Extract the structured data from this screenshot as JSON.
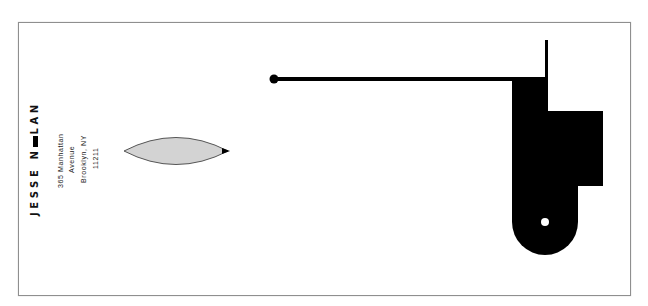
{
  "card": {
    "name": "JESSE N▬lAN",
    "name_display": "JESSE NOLAN",
    "address": {
      "line1": "365 Manhattan",
      "line2": "Avenue",
      "line3": "Brooklyn, NY",
      "line4": "11211"
    }
  },
  "colors": {
    "ink": "#000000",
    "leaf_fill": "#d3d3d3",
    "border": "#8f8f8f",
    "background": "#ffffff"
  },
  "graphics": {
    "leaf_shape": "lens-icon",
    "machine_shape": "abstract-black-form"
  }
}
